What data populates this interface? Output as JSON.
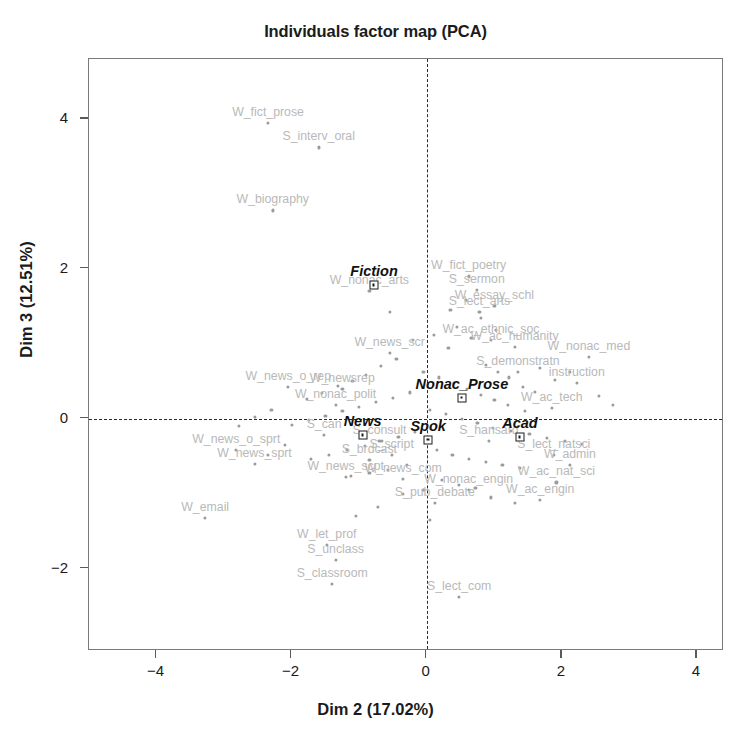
{
  "chart_data": {
    "type": "scatter",
    "title": "Individuals factor map (PCA)",
    "xlabel": "Dim 2 (17.02%)",
    "ylabel": "Dim 3 (12.51%)",
    "xlim": [
      -5.0,
      4.4
    ],
    "ylim": [
      -3.1,
      4.8
    ],
    "xticks": [
      -4,
      -2,
      0,
      2,
      4
    ],
    "yticks": [
      -2,
      0,
      2,
      4
    ],
    "grid": false,
    "legend": "none",
    "reference_lines": {
      "horizontal": 0,
      "vertical": 0,
      "style": "dashed",
      "color": "#2a2a2a"
    },
    "point_color": "#9b9b9b",
    "label_color": "#b9b9b9",
    "centroid_color": "#111111",
    "individuals": [
      {
        "label": "W_fict_prose",
        "x": -2.35,
        "y": 3.95
      },
      {
        "label": "S_interv_oral",
        "x": -1.6,
        "y": 3.62
      },
      {
        "label": "W_biography",
        "x": -2.28,
        "y": 2.78
      },
      {
        "label": "W_fict_poetry",
        "x": 0.62,
        "y": 1.9
      },
      {
        "label": "S_sermon",
        "x": 0.74,
        "y": 1.72
      },
      {
        "label": "W_nonac_arts",
        "x": -0.85,
        "y": 1.7
      },
      {
        "label": "W_essay_schl",
        "x": 1.0,
        "y": 1.5
      },
      {
        "label": "S_lect_arts",
        "x": 0.78,
        "y": 1.42
      },
      {
        "label": "W_ac_ethnic_soc",
        "x": 0.95,
        "y": 1.05
      },
      {
        "label": "W_ac_humanity",
        "x": 1.3,
        "y": 0.96
      },
      {
        "label": "W_news_scr",
        "x": -0.55,
        "y": 0.88
      },
      {
        "label": "W_nonac_med",
        "x": 2.4,
        "y": 0.82
      },
      {
        "label": "S_demonstratn",
        "x": 1.35,
        "y": 0.62
      },
      {
        "label": "instruction",
        "x": 2.22,
        "y": 0.48
      },
      {
        "label": "W_news_o_rep",
        "x": -2.05,
        "y": 0.42
      },
      {
        "label": "W_newsrep",
        "x": -1.25,
        "y": 0.4
      },
      {
        "label": "W_nonac_polit",
        "x": -1.35,
        "y": 0.18
      },
      {
        "label": "W_ac_tech",
        "x": 1.85,
        "y": 0.14
      },
      {
        "label": "W_news_o_sprt",
        "x": -2.82,
        "y": -0.42
      },
      {
        "label": "W_news_sprt",
        "x": -2.55,
        "y": -0.6
      },
      {
        "label": "S_can",
        "x": -1.52,
        "y": -0.22
      },
      {
        "label": "S_consult",
        "x": -0.7,
        "y": -0.3
      },
      {
        "label": "S_script",
        "x": -0.52,
        "y": -0.48
      },
      {
        "label": "S_brdcast",
        "x": -0.85,
        "y": -0.55
      },
      {
        "label": "W_news_scpt",
        "x": -1.2,
        "y": -0.78
      },
      {
        "label": "W_news_com",
        "x": -0.35,
        "y": -0.8
      },
      {
        "label": "S_hansard",
        "x": 0.92,
        "y": -0.3
      },
      {
        "label": "S_lect_natsci",
        "x": 1.88,
        "y": -0.48
      },
      {
        "label": "W_admin",
        "x": 2.12,
        "y": -0.62
      },
      {
        "label": "W_ac_nat_sci",
        "x": 1.92,
        "y": -0.85
      },
      {
        "label": "W_nonac_engin",
        "x": 0.62,
        "y": -0.95
      },
      {
        "label": "W_ac_engin",
        "x": 1.68,
        "y": -1.08
      },
      {
        "label": "S_pub_debate",
        "x": 0.12,
        "y": -1.12
      },
      {
        "label": "W_email",
        "x": -3.28,
        "y": -1.32
      },
      {
        "label": "W_let_prof",
        "x": -1.48,
        "y": -1.68
      },
      {
        "label": "S_unclass",
        "x": -1.35,
        "y": -1.88
      },
      {
        "label": "S_classroom",
        "x": -1.4,
        "y": -2.2
      },
      {
        "label": "S_lect_com",
        "x": 0.48,
        "y": -2.38
      }
    ],
    "centroids": [
      {
        "label": "Fiction",
        "x": -0.78,
        "y": 1.78
      },
      {
        "label": "Nonac_Prose",
        "x": 0.52,
        "y": 0.28
      },
      {
        "label": "News",
        "x": -0.95,
        "y": -0.22
      },
      {
        "label": "Spok",
        "x": 0.02,
        "y": -0.28
      },
      {
        "label": "Acad",
        "x": 1.38,
        "y": -0.25
      }
    ],
    "cloud_points": [
      [
        -0.2,
        1.05
      ],
      [
        0.1,
        1.12
      ],
      [
        0.32,
        0.95
      ],
      [
        0.45,
        1.22
      ],
      [
        0.66,
        1.08
      ],
      [
        0.88,
        0.72
      ],
      [
        1.05,
        0.62
      ],
      [
        1.22,
        0.55
      ],
      [
        1.42,
        0.42
      ],
      [
        1.6,
        0.36
      ],
      [
        -0.45,
        0.8
      ],
      [
        -0.68,
        0.7
      ],
      [
        -0.9,
        0.58
      ],
      [
        -1.1,
        0.5
      ],
      [
        -1.32,
        0.44
      ],
      [
        -1.55,
        0.34
      ],
      [
        -1.78,
        0.26
      ],
      [
        -0.05,
        0.62
      ],
      [
        0.18,
        0.55
      ],
      [
        0.4,
        0.48
      ],
      [
        0.6,
        0.4
      ],
      [
        0.8,
        0.32
      ],
      [
        1.0,
        0.25
      ],
      [
        1.2,
        0.18
      ],
      [
        1.45,
        0.1
      ],
      [
        -0.25,
        0.35
      ],
      [
        -0.5,
        0.28
      ],
      [
        -0.75,
        0.22
      ],
      [
        -1.0,
        0.16
      ],
      [
        -1.25,
        0.1
      ],
      [
        -1.5,
        0.04
      ],
      [
        -1.75,
        -0.02
      ],
      [
        -2.0,
        -0.08
      ],
      [
        0.05,
        0.12
      ],
      [
        0.28,
        0.06
      ],
      [
        0.52,
        0.0
      ],
      [
        0.75,
        -0.06
      ],
      [
        0.98,
        -0.12
      ],
      [
        1.25,
        -0.16
      ],
      [
        1.52,
        -0.2
      ],
      [
        1.78,
        -0.26
      ],
      [
        2.05,
        -0.3
      ],
      [
        2.3,
        -0.34
      ],
      [
        -0.18,
        -0.18
      ],
      [
        -0.42,
        -0.24
      ],
      [
        -0.66,
        -0.3
      ],
      [
        -0.92,
        -0.36
      ],
      [
        -1.18,
        -0.42
      ],
      [
        -1.45,
        -0.48
      ],
      [
        -1.72,
        -0.54
      ],
      [
        0.15,
        -0.42
      ],
      [
        0.38,
        -0.48
      ],
      [
        0.62,
        -0.54
      ],
      [
        0.88,
        -0.58
      ],
      [
        1.12,
        -0.62
      ],
      [
        1.38,
        -0.66
      ],
      [
        -0.3,
        -0.62
      ],
      [
        -0.58,
        -0.68
      ],
      [
        -0.85,
        -0.72
      ],
      [
        -1.12,
        -0.76
      ],
      [
        0.22,
        -0.82
      ],
      [
        0.48,
        -0.88
      ],
      [
        0.72,
        -0.92
      ],
      [
        -0.05,
        -0.95
      ],
      [
        -0.35,
        -1.0
      ],
      [
        2.55,
        0.3
      ],
      [
        2.75,
        0.18
      ],
      [
        -2.3,
        0.12
      ],
      [
        -2.55,
        0.02
      ],
      [
        -2.78,
        -0.1
      ],
      [
        0.35,
        1.45
      ],
      [
        0.58,
        1.58
      ],
      [
        0.8,
        1.35
      ],
      [
        1.02,
        1.18
      ],
      [
        -0.55,
        1.42
      ],
      [
        1.68,
        0.68
      ],
      [
        1.9,
        0.52
      ],
      [
        2.12,
        0.62
      ],
      [
        -2.1,
        -0.35
      ],
      [
        -2.35,
        -0.48
      ],
      [
        0.95,
        -1.05
      ],
      [
        1.3,
        -1.12
      ],
      [
        -0.72,
        -1.18
      ],
      [
        -1.05,
        -1.3
      ],
      [
        0.05,
        -1.35
      ]
    ]
  }
}
